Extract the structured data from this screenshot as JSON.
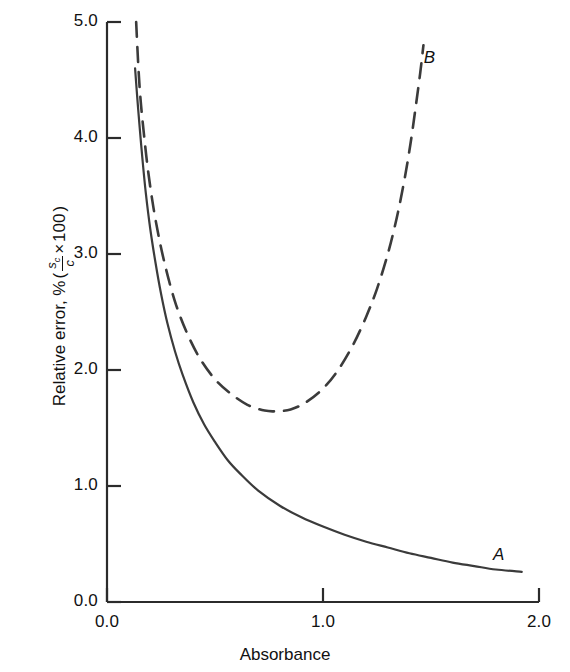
{
  "chart_data": {
    "type": "line",
    "title": "",
    "xlabel": "Absorbance",
    "ylabel": "Relative error, % (s_c/c × 100)",
    "ylabel_parts": {
      "prefix": "Relative error, %",
      "open_paren": "(",
      "numerator": "s",
      "numerator_sub": "c",
      "denominator": "c",
      "times": "×",
      "factor": "100",
      "close_paren": ")"
    },
    "xlim": [
      0.0,
      2.0
    ],
    "ylim": [
      0.0,
      5.0
    ],
    "xticks": [
      "0.0",
      "1.0",
      "2.0"
    ],
    "xtick_values": [
      0.0,
      1.0,
      2.0
    ],
    "yticks": [
      "0.0",
      "1.0",
      "2.0",
      "3.0",
      "4.0",
      "5.0"
    ],
    "ytick_values": [
      0.0,
      1.0,
      2.0,
      3.0,
      4.0,
      5.0
    ],
    "grid": false,
    "legend": "inline-curve-labels",
    "series": [
      {
        "name": "A",
        "label": "A",
        "style": "solid",
        "color": "#3b3b3b",
        "label_position": {
          "x": 1.81,
          "y": 0.4
        },
        "points": [
          [
            0.13,
            4.6
          ],
          [
            0.14,
            4.35
          ],
          [
            0.15,
            4.12
          ],
          [
            0.165,
            3.8
          ],
          [
            0.18,
            3.52
          ],
          [
            0.2,
            3.22
          ],
          [
            0.225,
            2.92
          ],
          [
            0.25,
            2.66
          ],
          [
            0.28,
            2.4
          ],
          [
            0.315,
            2.16
          ],
          [
            0.35,
            1.96
          ],
          [
            0.4,
            1.72
          ],
          [
            0.45,
            1.53
          ],
          [
            0.5,
            1.38
          ],
          [
            0.56,
            1.22
          ],
          [
            0.62,
            1.1
          ],
          [
            0.7,
            0.96
          ],
          [
            0.8,
            0.83
          ],
          [
            0.9,
            0.73
          ],
          [
            1.0,
            0.65
          ],
          [
            1.1,
            0.58
          ],
          [
            1.2,
            0.52
          ],
          [
            1.3,
            0.47
          ],
          [
            1.4,
            0.42
          ],
          [
            1.5,
            0.38
          ],
          [
            1.6,
            0.34
          ],
          [
            1.7,
            0.31
          ],
          [
            1.8,
            0.28
          ],
          [
            1.92,
            0.26
          ]
        ]
      },
      {
        "name": "B",
        "label": "B",
        "style": "dashed",
        "color": "#3b3b3b",
        "label_position": {
          "x": 1.49,
          "y": 4.68
        },
        "points": [
          [
            0.135,
            5.0
          ],
          [
            0.145,
            4.62
          ],
          [
            0.155,
            4.34
          ],
          [
            0.17,
            4.05
          ],
          [
            0.19,
            3.72
          ],
          [
            0.215,
            3.4
          ],
          [
            0.245,
            3.1
          ],
          [
            0.28,
            2.82
          ],
          [
            0.32,
            2.56
          ],
          [
            0.37,
            2.32
          ],
          [
            0.43,
            2.1
          ],
          [
            0.5,
            1.92
          ],
          [
            0.57,
            1.8
          ],
          [
            0.65,
            1.7
          ],
          [
            0.73,
            1.65
          ],
          [
            0.79,
            1.645
          ],
          [
            0.85,
            1.66
          ],
          [
            0.92,
            1.72
          ],
          [
            1.0,
            1.84
          ],
          [
            1.07,
            2.0
          ],
          [
            1.14,
            2.22
          ],
          [
            1.2,
            2.46
          ],
          [
            1.25,
            2.7
          ],
          [
            1.3,
            3.0
          ],
          [
            1.34,
            3.3
          ],
          [
            1.375,
            3.62
          ],
          [
            1.405,
            3.95
          ],
          [
            1.43,
            4.28
          ],
          [
            1.45,
            4.56
          ],
          [
            1.465,
            4.8
          ]
        ]
      }
    ]
  }
}
